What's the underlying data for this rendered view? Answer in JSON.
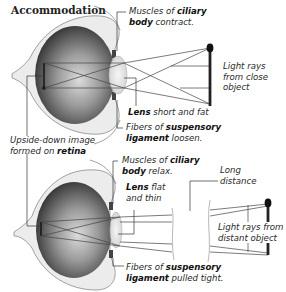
{
  "title": "Accommodation",
  "near_focus": {
    "ciliary_label": {
      "pre": "Muscles of ",
      "bold1": "ciliary",
      "bold2": "body",
      "post": " contract."
    },
    "lens_label": {
      "bold": "Lens",
      "post": " short and fat"
    },
    "ligament_label": {
      "pre": "Fibers of ",
      "bold1": "suspensory",
      "bold2": "ligament",
      "post": " loosen."
    },
    "rays_label": {
      "line1": "Light rays",
      "line2": "from close",
      "line3": "object"
    }
  },
  "retina_label": {
    "line1": "Upside-down image",
    "pre2": "formed on ",
    "bold": "retina"
  },
  "far_focus": {
    "ciliary_label": {
      "pre": "Muscles of ",
      "bold1": "ciliary",
      "bold2": "body",
      "post": " relax."
    },
    "lens_label": {
      "bold": "Lens",
      "post1": " flat",
      "line2": "and thin"
    },
    "ligament_label": {
      "pre": "Fibers of ",
      "bold1": "suspensory",
      "bold2": "ligament",
      "post": " pulled tight."
    },
    "distance_label": {
      "line1": "Long",
      "line2": "distance"
    },
    "rays_label": {
      "line1": "Light rays from",
      "line2": "distant object"
    }
  },
  "colors": {
    "sclera": "#ececec",
    "sclera_edge": "#8a8a8a",
    "vitreous_dark": "#3a3a3a",
    "vitreous_light": "#d8d8d8",
    "lens": "#e6e6e6",
    "ray": "#444444",
    "object": "#111111",
    "leader": "#333333"
  }
}
